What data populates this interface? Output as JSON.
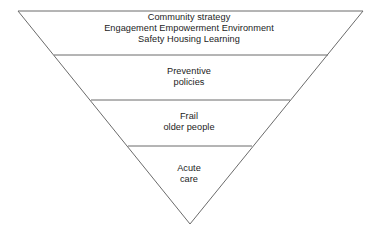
{
  "diagram": {
    "type": "inverted-triangle-hierarchy",
    "shape_name": "inverted-triangle",
    "background_color": "#ffffff",
    "outline_color": "#6b6b6b",
    "divider_color": "#6b6b6b",
    "text_color": "#1c1c1c",
    "geometry": {
      "top_left_x": 18,
      "top_right_x": 363,
      "top_y": 11,
      "apex_x": 190,
      "apex_y": 224,
      "divider_y_values": [
        55,
        100,
        146
      ]
    },
    "bands": [
      {
        "id": "community-strategy",
        "lines": [
          "Community strategy",
          "Engagement Empowerment Environment",
          "Safety Housing Learning"
        ]
      },
      {
        "id": "preventive-policies",
        "lines": [
          "Preventive",
          "policies"
        ]
      },
      {
        "id": "frail-older-people",
        "lines": [
          "Frail",
          "older people"
        ]
      },
      {
        "id": "acute-care",
        "lines": [
          "Acute",
          "care"
        ]
      }
    ]
  }
}
